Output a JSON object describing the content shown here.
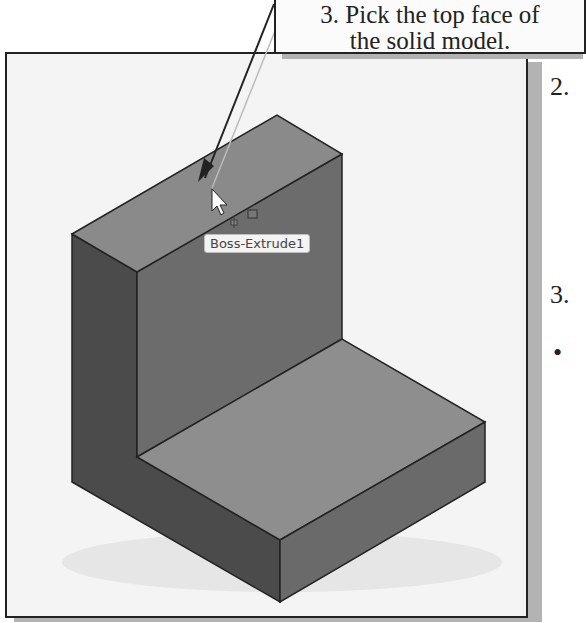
{
  "callout": {
    "line1": "3. Pick the top face of",
    "line2": "the solid model."
  },
  "viewport": {
    "tooltip": "Boss-Extrude1",
    "cursor_icon": "arrow-pointer",
    "filter_icon": "face-select-filter"
  },
  "margin": {
    "step2": "2.",
    "step3": "3.",
    "bullet": "•"
  },
  "colors": {
    "top_face": "#8a8a8a",
    "front_face": "#6e6e6e",
    "side_face": "#4d4d4d",
    "base_top": "#8e8e8e",
    "base_front": "#6a6a6a",
    "edge": "#222222",
    "panel_bg": "#f4f4f4"
  }
}
